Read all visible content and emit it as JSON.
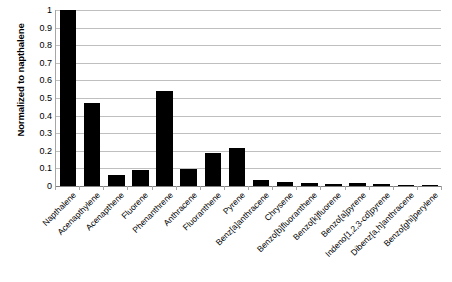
{
  "chart_data": {
    "type": "bar",
    "title": "",
    "subtitle": "",
    "xlabel": "",
    "ylabel": "Normalized to napthalene",
    "ylim": [
      0,
      1
    ],
    "ytick_labels": [
      "1",
      "0.9",
      "0.8",
      "0.7",
      "0.6",
      "0.5",
      "0.4",
      "0.3",
      "0.2",
      "0.1",
      "0"
    ],
    "ytick_values": [
      1,
      0.9,
      0.8,
      0.7,
      0.6,
      0.5,
      0.4,
      0.3,
      0.2,
      0.1,
      0
    ],
    "grid": "horizontal",
    "legend": "none",
    "bar_color": "#000000",
    "gridline_color": "#bfbfbf",
    "axis_color": "#a6a6a6",
    "categories": [
      "Napthalene",
      "Acenapthylene",
      "Acenapthene",
      "Fluorene",
      "Phenanthrene",
      "Anthracene",
      "Fluoranthene",
      "Pyrene",
      "Benz[a]anthracene",
      "Chrysene",
      "Benzo[b]fluoranthene",
      "Benzo[k]fluorene",
      "Benzo[a]pyrene",
      "Indeno[1,2,3-cd]pyrene",
      "Dibenz[a,h]anthracene",
      "Benzo[ghi]perylene"
    ],
    "values": [
      1.0,
      0.47,
      0.06,
      0.09,
      0.54,
      0.095,
      0.185,
      0.215,
      0.035,
      0.025,
      0.015,
      0.01,
      0.018,
      0.01,
      0.004,
      0.006
    ]
  }
}
